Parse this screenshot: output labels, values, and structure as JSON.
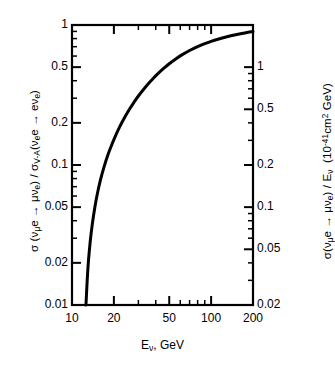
{
  "figure": {
    "background": "#ffffff",
    "ink": "#000000"
  },
  "axes": {
    "left": {
      "title_html": "&#963; (&#957;<sub>&#956;</sub>e &#8594; &#956;&#957;<sub>e</sub>) / &#963;<sub>V-A</sub>(&#957;<sub>e</sub>e &#8594; e&#957;<sub>e</sub>)",
      "title_plain": "sigma(nu_mu e -> mu nu_e) / sigma_V-A(nu_e e -> e nu_e)",
      "scale": "log",
      "min": 0.01,
      "max": 1,
      "tick_values": [
        1,
        0.5,
        0.2,
        0.1,
        0.05,
        0.02,
        0.01
      ],
      "tick_labels": [
        "1",
        "0.5",
        "0.2",
        "0.1",
        "0.05",
        "0.02",
        "0.01"
      ]
    },
    "right": {
      "title_html": "&#963;(&#957;<sub>&#956;</sub>e &#8594; &#956;&#957;<sub>e</sub>) / E<sub>&#957;</sub>&nbsp; (10<sup>-41</sup>cm<sup>2</sup> GeV)",
      "title_plain": "sigma(nu_mu e -> mu nu_e) / E_nu (10^-41 cm^2 GeV)",
      "scale": "log",
      "min": 0.02,
      "max": 2,
      "tick_values": [
        1,
        0.5,
        0.2,
        0.1,
        0.05,
        0.02
      ],
      "tick_labels": [
        "1",
        "0.5",
        "0.2",
        "0.1",
        "0.05",
        "0.02"
      ]
    },
    "x": {
      "title_html": "E<sub>&#957;</sub>, GeV",
      "title_plain": "E_nu, GeV",
      "scale": "log",
      "min": 10,
      "max": 200,
      "tick_values": [
        10,
        20,
        50,
        100,
        200
      ],
      "tick_labels": [
        "10",
        "20",
        "50",
        "100",
        "200"
      ]
    }
  },
  "chart_data": {
    "type": "line",
    "title": "",
    "xlabel": "E_nu, GeV",
    "ylabel": "sigma(nu_mu e -> mu nu_e) / sigma_V-A(nu_e e -> e nu_e)",
    "ylabel_right": "sigma(nu_mu e -> mu nu_e) / E_nu (10^-41 cm^2 GeV)",
    "xscale": "log",
    "yscale": "log",
    "xlim": [
      10,
      200
    ],
    "ylim": [
      0.01,
      1
    ],
    "ylim_right": [
      0.02,
      2
    ],
    "grid": false,
    "legend": null,
    "series": [
      {
        "name": "cross-section ratio",
        "linewidth": 3,
        "color": "#000000",
        "x": [
          12.6,
          13.0,
          13.5,
          14.0,
          14.6,
          15.2,
          16.0,
          17.0,
          18.0,
          19.0,
          20.0,
          22.0,
          24.0,
          26.0,
          28.0,
          30.0,
          34.0,
          38.0,
          42.0,
          46.0,
          50.0,
          56.0,
          62.0,
          70.0,
          80.0,
          90.0,
          100.0,
          115.0,
          130.0,
          150.0,
          170.0,
          200.0
        ],
        "y": [
          0.01,
          0.018,
          0.028,
          0.038,
          0.05,
          0.062,
          0.078,
          0.097,
          0.116,
          0.134,
          0.152,
          0.187,
          0.22,
          0.252,
          0.282,
          0.311,
          0.364,
          0.412,
          0.455,
          0.494,
          0.529,
          0.575,
          0.614,
          0.657,
          0.7,
          0.735,
          0.763,
          0.797,
          0.824,
          0.852,
          0.874,
          0.9
        ]
      }
    ]
  },
  "caption_fragment": ""
}
